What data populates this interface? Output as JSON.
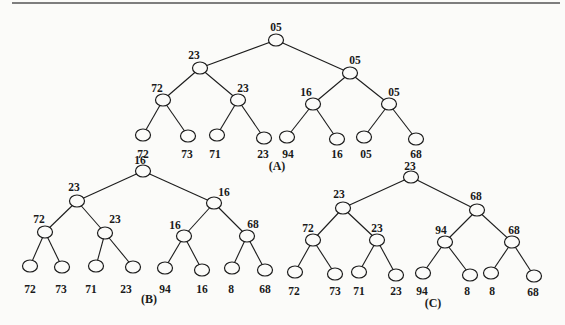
{
  "figure": {
    "trees": [
      {
        "id": "A",
        "caption": "(A)",
        "caption_pos": [
          277,
          167
        ],
        "nodes": [
          {
            "label": "05",
            "x": 276,
            "y": 40,
            "lx": 276,
            "ly": 28
          },
          {
            "label": "23",
            "x": 200,
            "y": 68,
            "lx": 194,
            "ly": 56
          },
          {
            "label": "05",
            "x": 350,
            "y": 73,
            "lx": 355,
            "ly": 61
          },
          {
            "label": "72",
            "x": 163,
            "y": 100,
            "lx": 157,
            "ly": 89
          },
          {
            "label": "23",
            "x": 238,
            "y": 100,
            "lx": 243,
            "ly": 89
          },
          {
            "label": "16",
            "x": 313,
            "y": 104,
            "lx": 306,
            "ly": 93
          },
          {
            "label": "05",
            "x": 389,
            "y": 104,
            "lx": 394,
            "ly": 93
          },
          {
            "label": "72",
            "x": 143,
            "y": 135,
            "lx": 143,
            "ly": 155
          },
          {
            "label": "73",
            "x": 188,
            "y": 136,
            "lx": 187,
            "ly": 155
          },
          {
            "label": "71",
            "x": 217,
            "y": 135,
            "lx": 215,
            "ly": 155
          },
          {
            "label": "23",
            "x": 264,
            "y": 138,
            "lx": 263,
            "ly": 155
          },
          {
            "label": "94",
            "x": 287,
            "y": 137,
            "lx": 288,
            "ly": 155
          },
          {
            "label": "16",
            "x": 337,
            "y": 139,
            "lx": 337,
            "ly": 155
          },
          {
            "label": "05",
            "x": 364,
            "y": 137,
            "lx": 366,
            "ly": 155
          },
          {
            "label": "68",
            "x": 416,
            "y": 139,
            "lx": 416,
            "ly": 155
          }
        ]
      },
      {
        "id": "B",
        "caption": "(B)",
        "caption_pos": [
          149,
          300
        ],
        "nodes": [
          {
            "label": "16",
            "x": 143,
            "y": 171,
            "lx": 140,
            "ly": 161
          },
          {
            "label": "23",
            "x": 77,
            "y": 201,
            "lx": 74,
            "ly": 188
          },
          {
            "label": "16",
            "x": 214,
            "y": 203,
            "lx": 224,
            "ly": 193
          },
          {
            "label": "72",
            "x": 45,
            "y": 232,
            "lx": 39,
            "ly": 220
          },
          {
            "label": "23",
            "x": 105,
            "y": 233,
            "lx": 115,
            "ly": 220
          },
          {
            "label": "16",
            "x": 184,
            "y": 236,
            "lx": 175,
            "ly": 226
          },
          {
            "label": "68",
            "x": 247,
            "y": 236,
            "lx": 253,
            "ly": 225
          },
          {
            "label": "72",
            "x": 30,
            "y": 266,
            "lx": 30,
            "ly": 290
          },
          {
            "label": "73",
            "x": 62,
            "y": 267,
            "lx": 61,
            "ly": 290
          },
          {
            "label": "71",
            "x": 96,
            "y": 266,
            "lx": 91,
            "ly": 290
          },
          {
            "label": "23",
            "x": 133,
            "y": 267,
            "lx": 126,
            "ly": 290
          },
          {
            "label": "94",
            "x": 165,
            "y": 268,
            "lx": 165,
            "ly": 290
          },
          {
            "label": "16",
            "x": 202,
            "y": 270,
            "lx": 202,
            "ly": 290
          },
          {
            "label": "8",
            "x": 232,
            "y": 268,
            "lx": 231,
            "ly": 290
          },
          {
            "label": "68",
            "x": 265,
            "y": 270,
            "lx": 265,
            "ly": 290
          }
        ]
      },
      {
        "id": "C",
        "caption": "(C)",
        "caption_pos": [
          433,
          304
        ],
        "nodes": [
          {
            "label": "23",
            "x": 411,
            "y": 177,
            "lx": 410,
            "ly": 167
          },
          {
            "label": "23",
            "x": 343,
            "y": 208,
            "lx": 339,
            "ly": 195
          },
          {
            "label": "68",
            "x": 477,
            "y": 210,
            "lx": 476,
            "ly": 197
          },
          {
            "label": "72",
            "x": 313,
            "y": 240,
            "lx": 308,
            "ly": 229
          },
          {
            "label": "23",
            "x": 377,
            "y": 240,
            "lx": 377,
            "ly": 229
          },
          {
            "label": "94",
            "x": 445,
            "y": 242,
            "lx": 441,
            "ly": 231
          },
          {
            "label": "68",
            "x": 512,
            "y": 242,
            "lx": 514,
            "ly": 231
          },
          {
            "label": "72",
            "x": 295,
            "y": 272,
            "lx": 294,
            "ly": 292
          },
          {
            "label": "73",
            "x": 335,
            "y": 274,
            "lx": 335,
            "ly": 292
          },
          {
            "label": "71",
            "x": 359,
            "y": 272,
            "lx": 359,
            "ly": 292
          },
          {
            "label": "23",
            "x": 396,
            "y": 275,
            "lx": 396,
            "ly": 292
          },
          {
            "label": "94",
            "x": 423,
            "y": 273,
            "lx": 422,
            "ly": 292
          },
          {
            "label": "8",
            "x": 470,
            "y": 275,
            "lx": 467,
            "ly": 292
          },
          {
            "label": "8",
            "x": 491,
            "y": 273,
            "lx": 492,
            "ly": 292
          },
          {
            "label": "68",
            "x": 534,
            "y": 276,
            "lx": 533,
            "ly": 293
          }
        ]
      }
    ],
    "colors": {
      "line": "#1c1c1c",
      "background": "#fbfbf9",
      "text": "#1a1a1a",
      "rule": "#555555"
    }
  }
}
